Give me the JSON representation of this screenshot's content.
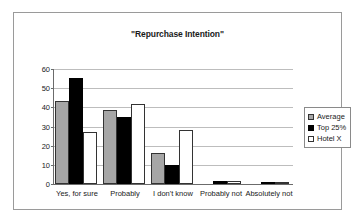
{
  "chart_data": {
    "type": "bar",
    "title": "\"Repurchase Intention\"",
    "xlabel": "",
    "ylabel": "",
    "ylim": [
      0,
      60
    ],
    "yticks": [
      0,
      10,
      20,
      30,
      40,
      50,
      60
    ],
    "grid": true,
    "legend_position": "right",
    "categories": [
      "Yes, for sure",
      "Probably",
      "I don't know",
      "Probably not",
      "Absolutely not"
    ],
    "series": [
      {
        "name": "Average",
        "color": "#a6a6a6",
        "values": [
          43,
          38.5,
          16,
          0,
          0
        ]
      },
      {
        "name": "Top 25%",
        "color": "#000000",
        "values": [
          55,
          34.5,
          10,
          1.5,
          0.8
        ]
      },
      {
        "name": "Hotel X",
        "color": "#ffffff",
        "values": [
          27,
          41.5,
          28,
          1.5,
          1.2
        ]
      }
    ]
  },
  "legend": {
    "items": [
      {
        "label": "Average"
      },
      {
        "label": "Top 25%"
      },
      {
        "label": "Hotel X"
      }
    ]
  }
}
